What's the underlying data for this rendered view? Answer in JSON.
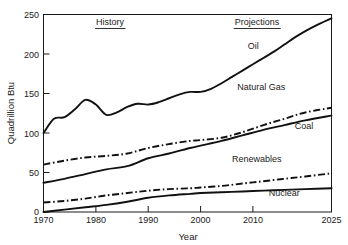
{
  "chart_data": {
    "type": "line",
    "title": "",
    "xlabel": "Year",
    "ylabel": "Quadrillion Btu",
    "xlim": [
      1970,
      2025
    ],
    "ylim": [
      0,
      250
    ],
    "grid": false,
    "legend_position": "inline-labels",
    "xticks": [
      1970,
      1980,
      1990,
      2000,
      2010,
      2025
    ],
    "xtick_labels": [
      "1970",
      "1980",
      "1990",
      "2000",
      "2010",
      "2025"
    ],
    "yticks": [
      0,
      50,
      100,
      150,
      200,
      250
    ],
    "ytick_labels": [
      "0",
      "50",
      "100",
      "150",
      "200",
      "250"
    ],
    "annotations": [
      {
        "text": "History",
        "underlined": true,
        "x": 1980,
        "y": 238
      },
      {
        "text": "Projections",
        "underlined": true,
        "x": 2010,
        "y": 238
      }
    ],
    "series": [
      {
        "name": "Oil",
        "label": "Oil",
        "style": "solid",
        "color": "#111111",
        "x": [
          1970,
          1972,
          1974,
          1976,
          1978,
          1980,
          1982,
          1984,
          1986,
          1988,
          1990,
          1992,
          1994,
          1996,
          1998,
          2000,
          2002,
          2004,
          2006,
          2008,
          2010,
          2012,
          2014,
          2016,
          2018,
          2020,
          2022,
          2025
        ],
        "values": [
          100,
          118,
          120,
          130,
          142,
          136,
          123,
          126,
          133,
          137,
          136,
          139,
          144,
          149,
          152,
          152,
          156,
          163,
          171,
          179,
          187,
          195,
          203,
          212,
          221,
          229,
          236,
          245
        ]
      },
      {
        "name": "Natural Gas",
        "label": "Natural Gas",
        "style": "dash-dot",
        "color": "#111111",
        "x": [
          1970,
          1974,
          1978,
          1982,
          1986,
          1990,
          1994,
          1998,
          2000,
          2004,
          2008,
          2012,
          2016,
          2020,
          2025
        ],
        "values": [
          60,
          65,
          69,
          71,
          74,
          81,
          86,
          90,
          91,
          94,
          101,
          110,
          118,
          126,
          132
        ]
      },
      {
        "name": "Coal",
        "label": "Coal",
        "style": "solid",
        "color": "#111111",
        "x": [
          1970,
          1974,
          1978,
          1982,
          1986,
          1990,
          1994,
          1998,
          2000,
          2004,
          2008,
          2012,
          2016,
          2020,
          2025
        ],
        "values": [
          37,
          42,
          48,
          54,
          58,
          68,
          74,
          81,
          84,
          90,
          97,
          104,
          110,
          116,
          122
        ]
      },
      {
        "name": "Renewables",
        "label": "Renewables",
        "style": "dash-dot",
        "color": "#111111",
        "x": [
          1970,
          1974,
          1978,
          1982,
          1986,
          1990,
          1994,
          1998,
          2000,
          2004,
          2008,
          2012,
          2016,
          2020,
          2025
        ],
        "values": [
          12,
          14,
          17,
          21,
          24,
          27,
          29,
          30,
          31,
          33,
          36,
          39,
          42,
          45,
          49
        ]
      },
      {
        "name": "Nuclear",
        "label": "Nuclear",
        "style": "solid",
        "color": "#111111",
        "x": [
          1970,
          1974,
          1978,
          1982,
          1986,
          1990,
          1994,
          1998,
          2000,
          2004,
          2008,
          2012,
          2016,
          2020,
          2025
        ],
        "values": [
          0,
          3,
          6,
          9,
          13,
          18,
          21,
          23,
          24,
          25,
          26,
          27,
          28,
          29,
          30
        ]
      }
    ],
    "series_label_positions": [
      {
        "name": "Oil",
        "x": 2009,
        "y": 206
      },
      {
        "name": "Natural Gas",
        "x": 2007,
        "y": 154
      },
      {
        "name": "Coal",
        "x": 2018,
        "y": 105
      },
      {
        "name": "Renewables",
        "x": 2006,
        "y": 63
      },
      {
        "name": "Nuclear",
        "x": 2013,
        "y": 20
      }
    ]
  }
}
